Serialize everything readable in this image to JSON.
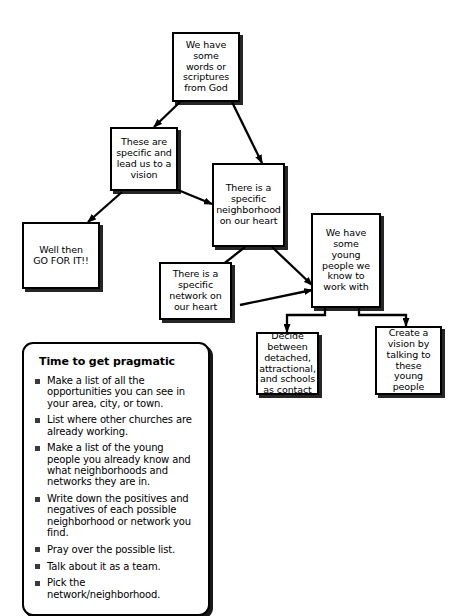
{
  "diagram": {
    "nodes": [
      {
        "id": "words",
        "label": "We have\nsome\nwords or\nscriptures\nfrom God"
      },
      {
        "id": "specific",
        "label": "These are\nspecific and\nlead us to a\nvision"
      },
      {
        "id": "neighborhood",
        "label": "There is a\nspecific\nneighborhood\non our heart"
      },
      {
        "id": "gofor",
        "label": "Well then\nGO FOR IT!!"
      },
      {
        "id": "network",
        "label": "There is a\nspecific\nnetwork on\nour heart"
      },
      {
        "id": "youngpeople",
        "label": "We have\nsome\nyoung\npeople we\nknow to\nwork with"
      },
      {
        "id": "decide",
        "label": "Decide\nbetween\ndetached,\nattractional,\nand schools\nas contact"
      },
      {
        "id": "createvision",
        "label": "Create a\nvision by\ntalking to\nthese\nyoung\npeople"
      }
    ],
    "edges": [
      {
        "from": "words",
        "to": "specific"
      },
      {
        "from": "words",
        "to": "neighborhood"
      },
      {
        "from": "specific",
        "to": "gofor"
      },
      {
        "from": "specific",
        "to": "neighborhood"
      },
      {
        "from": "neighborhood",
        "to": "network"
      },
      {
        "from": "neighborhood",
        "to": "youngpeople"
      },
      {
        "from": "network",
        "to": "youngpeople"
      },
      {
        "from": "youngpeople",
        "to": "decide"
      },
      {
        "from": "youngpeople",
        "to": "createvision"
      }
    ]
  },
  "pragmatic": {
    "title": "Time to get pragmatic",
    "items": [
      "Make a list of all the opportunities you can see in your area, city, or town.",
      "List where other churches are already working.",
      "Make a list of the young people you already know and what neighborhoods and networks they are in.",
      "Write down the positives and negatives of each possible neighborhood or network you find.",
      "Pray over the possible list.",
      "Talk about it as a team.",
      "Pick the network/neighborhood."
    ]
  },
  "colors": {
    "background": "#ffffff",
    "stroke": "#000000",
    "bullet": "#3a3a3a"
  }
}
